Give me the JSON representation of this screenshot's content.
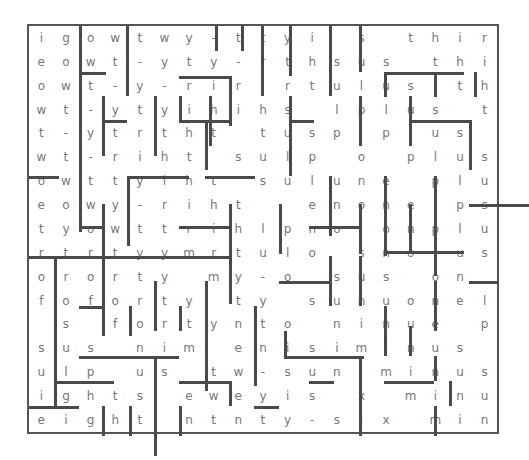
{
  "puzzle": {
    "type": "word-maze",
    "columns": 19,
    "rows": 16,
    "grid": [
      [
        "i",
        "g",
        "o",
        "w",
        "t",
        "w",
        "y",
        "-",
        "t",
        "t",
        "y",
        "i",
        "",
        "s",
        "",
        "t",
        "h",
        "i",
        "r"
      ],
      [
        "e",
        "o",
        "w",
        "t",
        "-",
        "y",
        "t",
        "y",
        "-",
        "r",
        "t",
        "h",
        "s",
        "u",
        "s",
        "",
        "t",
        "h",
        "i"
      ],
      [
        "o",
        "w",
        "t",
        "-",
        "y",
        "-",
        "r",
        "i",
        "r",
        "i",
        "r",
        "t",
        "u",
        "l",
        "u",
        "s",
        "",
        "t",
        "h"
      ],
      [
        "w",
        "t",
        "-",
        "y",
        "t",
        "y",
        "i",
        "h",
        "i",
        "h",
        "s",
        "",
        "l",
        "p",
        "l",
        "u",
        "s",
        "",
        "t"
      ],
      [
        "t",
        "-",
        "y",
        "t",
        "r",
        "t",
        "h",
        "t",
        "",
        "t",
        "u",
        "s",
        "p",
        "",
        "p",
        "l",
        "u",
        "s",
        ""
      ],
      [
        "w",
        "t",
        "-",
        "r",
        "i",
        "h",
        "t",
        "",
        "s",
        "u",
        "l",
        "p",
        "",
        "o",
        "",
        "p",
        "l",
        "u",
        "s"
      ],
      [
        "o",
        "w",
        "t",
        "t",
        "y",
        "i",
        "h",
        "t",
        "",
        "s",
        "u",
        "l",
        "u",
        "n",
        "e",
        "",
        "p",
        "l",
        "u"
      ],
      [
        "e",
        "o",
        "w",
        "y",
        "-",
        "r",
        "i",
        "h",
        "t",
        "",
        "",
        "e",
        "n",
        "o",
        "n",
        "e",
        "",
        "p",
        "s"
      ],
      [
        "t",
        "y",
        "o",
        "w",
        "t",
        "t",
        "r",
        "i",
        "h",
        "l",
        "p",
        "n",
        "o",
        "",
        "o",
        "n",
        "p",
        "l",
        "u"
      ],
      [
        "r",
        "t",
        "r",
        "t",
        "y",
        "y",
        "m",
        "r",
        "t",
        "u",
        "l",
        "o",
        "",
        "s",
        "n",
        "o",
        "l",
        "u",
        "s"
      ],
      [
        "o",
        "r",
        "o",
        "r",
        "t",
        "y",
        "",
        "m",
        "y",
        "-",
        "o",
        "",
        "s",
        "u",
        "s",
        "",
        "o",
        "n",
        ""
      ],
      [
        "f",
        "o",
        "f",
        "o",
        "r",
        "t",
        "y",
        "",
        "t",
        "y",
        "",
        "s",
        "u",
        "n",
        "u",
        "o",
        "n",
        "e",
        "l"
      ],
      [
        "",
        "s",
        "",
        "f",
        "o",
        "r",
        "t",
        "y",
        "n",
        "t",
        "o",
        "",
        "n",
        "i",
        "n",
        "u",
        "e",
        "",
        "p"
      ],
      [
        "s",
        "u",
        "s",
        "",
        "n",
        "i",
        "m",
        "",
        "e",
        "n",
        "i",
        "s",
        "i",
        "m",
        "i",
        "n",
        "u",
        "s",
        ""
      ],
      [
        "u",
        "l",
        "p",
        "",
        "u",
        "s",
        "",
        "t",
        "w",
        "-",
        "s",
        "u",
        "n",
        "",
        "m",
        "i",
        "n",
        "u",
        "s"
      ],
      [
        "i",
        "g",
        "h",
        "t",
        "s",
        "",
        "e",
        "w",
        "e",
        "y",
        "i",
        "s",
        "",
        "x",
        "",
        "m",
        "i",
        "n",
        "u"
      ],
      [
        "e",
        "i",
        "g",
        "h",
        "t",
        "",
        "n",
        "t",
        "n",
        "t",
        "y",
        "-",
        "s",
        "i",
        "x",
        "",
        "m",
        "i",
        "n"
      ]
    ]
  },
  "colors": {
    "wall": "#4a4a4a",
    "letter": "#777777",
    "background": "#ffffff"
  }
}
